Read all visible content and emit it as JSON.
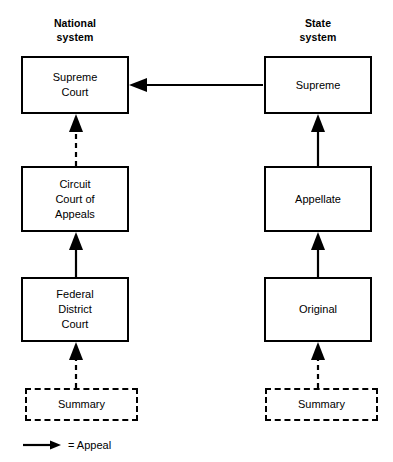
{
  "diagram": {
    "columns": [
      {
        "id": "national",
        "heading": "National\nsystem",
        "nodes": [
          {
            "id": "supreme-court",
            "label": "Supreme\nCourt"
          },
          {
            "id": "circuit-court-of-appeals",
            "label": "Circuit\nCourt of\nAppeals"
          },
          {
            "id": "federal-district-court",
            "label": "Federal\nDistrict\nCourt"
          },
          {
            "id": "summary-national",
            "label": "Summary"
          }
        ]
      },
      {
        "id": "state",
        "heading": "State\nsystem",
        "nodes": [
          {
            "id": "supreme",
            "label": "Supreme"
          },
          {
            "id": "appellate",
            "label": "Appellate"
          },
          {
            "id": "original",
            "label": "Original"
          },
          {
            "id": "summary-state",
            "label": "Summary"
          }
        ]
      }
    ],
    "edges": [
      {
        "id": "state-supreme-to-national-supreme",
        "from": "supreme",
        "to": "supreme-court",
        "style": "solid",
        "direction": "left"
      },
      {
        "id": "circuit-to-supreme-court",
        "from": "circuit-court-of-appeals",
        "to": "supreme-court",
        "style": "dashed",
        "direction": "up"
      },
      {
        "id": "district-to-circuit",
        "from": "federal-district-court",
        "to": "circuit-court-of-appeals",
        "style": "solid",
        "direction": "up"
      },
      {
        "id": "summary-to-district",
        "from": "summary-national",
        "to": "federal-district-court",
        "style": "dashed",
        "direction": "up"
      },
      {
        "id": "appellate-to-supreme",
        "from": "appellate",
        "to": "supreme",
        "style": "solid",
        "direction": "up"
      },
      {
        "id": "original-to-appellate",
        "from": "original",
        "to": "appellate",
        "style": "solid",
        "direction": "up"
      },
      {
        "id": "summary-to-original",
        "from": "summary-state",
        "to": "original",
        "style": "dashed",
        "direction": "up"
      }
    ],
    "legend": {
      "symbol": "arrow-right-icon",
      "text": "= Appeal"
    },
    "colors": {
      "stroke": "#000000",
      "background": "#ffffff",
      "text": "#000000"
    }
  }
}
